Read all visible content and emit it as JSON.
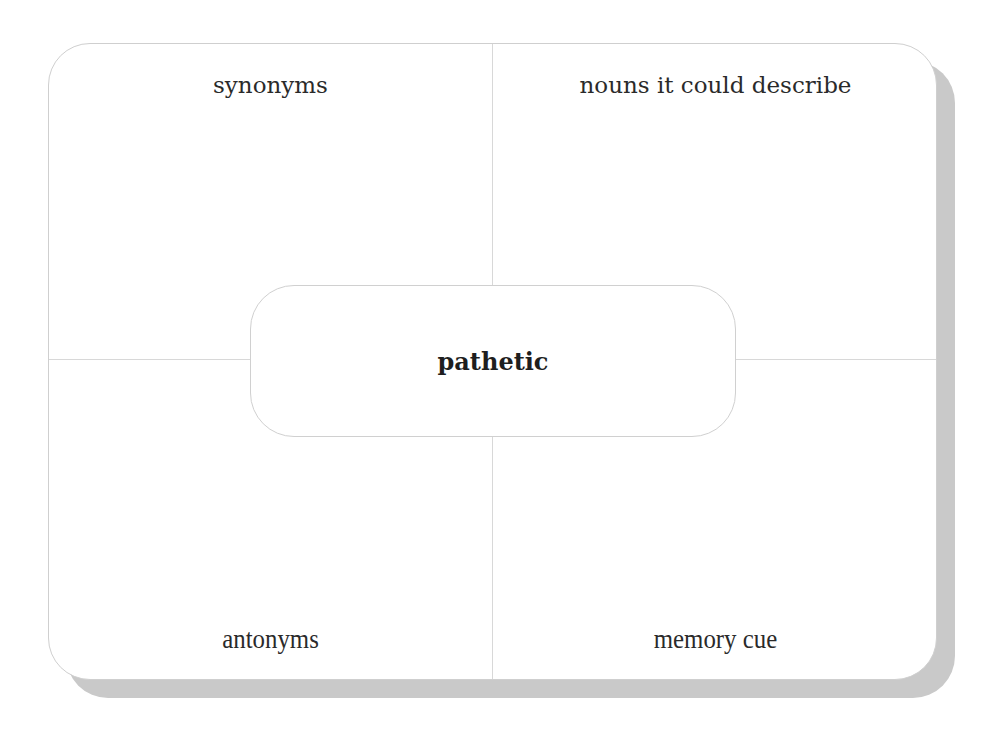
{
  "diagram": {
    "type": "frayer-model-vocabulary-card",
    "center_word": "pathetic",
    "quadrants": {
      "top_left": "synonyms",
      "top_right": "nouns it could describe",
      "bottom_left": "antonyms",
      "bottom_right": "memory cue"
    },
    "colors": {
      "card_background": "#ffffff",
      "border": "#cfcfcf",
      "shadow": "#c9c9c9",
      "divider": "#d8d8d8",
      "text": "#2a2a2a"
    }
  }
}
